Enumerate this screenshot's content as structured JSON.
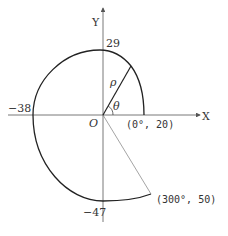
{
  "diagram": {
    "type": "polar-cam-profile",
    "axes": {
      "x_label": "X",
      "y_label": "Y",
      "origin_label": "O"
    },
    "angle_label": "θ",
    "radius_label": "ρ",
    "intercepts": {
      "y_positive": "29",
      "x_negative": "−38",
      "y_negative": "−47"
    },
    "points": {
      "start": "(0°, 20)",
      "end": "(300°, 50)"
    },
    "colors": {
      "curve": "#222222",
      "axis": "#555555",
      "text": "#333333"
    }
  }
}
